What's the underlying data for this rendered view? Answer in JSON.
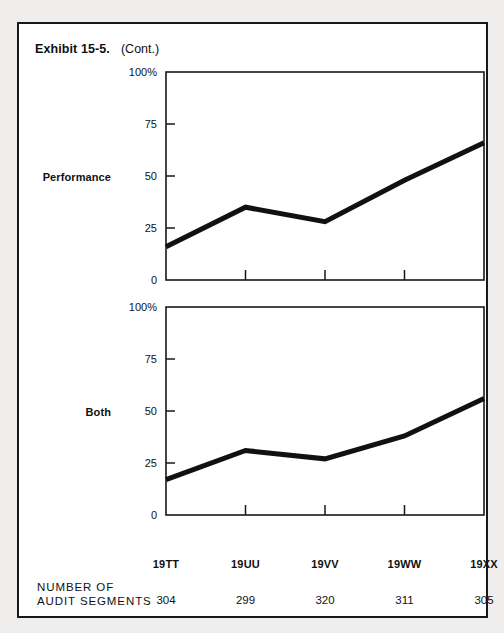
{
  "exhibit": {
    "number": "Exhibit 15-5.",
    "continued": "(Cont.)"
  },
  "charts": [
    {
      "id": "performance",
      "label": "Performance"
    },
    {
      "id": "both",
      "label": "Both"
    }
  ],
  "footer": {
    "caption_line1": "NUMBER OF",
    "caption_line2": "AUDIT SEGMENTS",
    "values": [
      "304",
      "299",
      "320",
      "311",
      "305"
    ]
  },
  "chart_data": [
    {
      "type": "line",
      "title": "Performance",
      "xlabel": "",
      "ylabel": "",
      "categories": [
        "19TT",
        "19UU",
        "19VV",
        "19WW",
        "19XX"
      ],
      "values": [
        16,
        35,
        28,
        48,
        66
      ],
      "ylim": [
        0,
        100
      ],
      "ytick_values": [
        0,
        25,
        50,
        75,
        100
      ],
      "ytick_labels": [
        "0",
        "25",
        "50",
        "75",
        "100%"
      ],
      "grid": false,
      "legend": "none",
      "line_color": "#111111"
    },
    {
      "type": "line",
      "title": "Both",
      "xlabel": "",
      "ylabel": "",
      "categories": [
        "19TT",
        "19UU",
        "19VV",
        "19WW",
        "19XX"
      ],
      "values": [
        17,
        31,
        27,
        38,
        56
      ],
      "ylim": [
        0,
        100
      ],
      "ytick_values": [
        0,
        25,
        50,
        75,
        100
      ],
      "ytick_labels": [
        "0",
        "25",
        "50",
        "75",
        "100%"
      ],
      "grid": false,
      "legend": "none",
      "line_color": "#111111"
    }
  ]
}
